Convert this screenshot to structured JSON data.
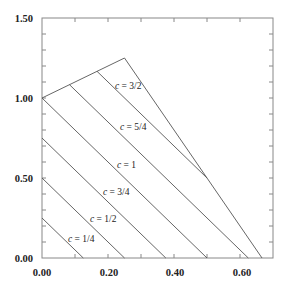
{
  "chart_data": {
    "type": "line",
    "title": "",
    "xlabel": "",
    "ylabel": "",
    "xlim": [
      0,
      0.7
    ],
    "ylim": [
      0,
      1.5
    ],
    "grid": false,
    "legend": "none",
    "x_ticks": [
      0.1,
      0.2,
      0.3,
      0.4,
      0.5,
      0.6
    ],
    "x_tick_labels": [
      {
        "value": 0.0,
        "label": "0.00"
      },
      {
        "value": 0.2,
        "label": "0.20"
      },
      {
        "value": 0.4,
        "label": "0.40"
      },
      {
        "value": 0.6,
        "label": "0.60"
      }
    ],
    "y_ticks": [
      0.1,
      0.2,
      0.3,
      0.4,
      0.5,
      0.6,
      0.7,
      0.8,
      0.9,
      1.0,
      1.1,
      1.2,
      1.3,
      1.4
    ],
    "y_tick_labels": [
      {
        "value": 0.0,
        "label": "0.00"
      },
      {
        "value": 0.5,
        "label": "0.50"
      },
      {
        "value": 1.0,
        "label": "1.00"
      },
      {
        "value": 1.5,
        "label": "1.50"
      }
    ],
    "boundary": {
      "name": "region boundary",
      "points": [
        [
          0.0,
          1.0
        ],
        [
          0.25,
          1.25
        ],
        [
          0.6667,
          0.0
        ]
      ]
    },
    "series": [
      {
        "name": "c = 1/4",
        "c": 0.25,
        "points": [
          [
            0.0,
            0.25
          ],
          [
            0.125,
            0.0
          ]
        ],
        "label_pos": [
          0.09,
          0.08
        ]
      },
      {
        "name": "c = 1/2",
        "c": 0.5,
        "points": [
          [
            0.0,
            0.5
          ],
          [
            0.25,
            0.0
          ]
        ],
        "label_pos": [
          0.155,
          0.24
        ]
      },
      {
        "name": "c = 3/4",
        "c": 0.75,
        "points": [
          [
            0.0,
            0.75
          ],
          [
            0.375,
            0.0
          ]
        ],
        "label_pos": [
          0.195,
          0.41
        ]
      },
      {
        "name": "c = 1",
        "c": 1.0,
        "points": [
          [
            0.0,
            1.0
          ],
          [
            0.5,
            0.0
          ]
        ],
        "label_pos": [
          0.228,
          0.58
        ]
      },
      {
        "name": "c = 5/4",
        "c": 1.25,
        "points": [
          [
            0.0833,
            1.0833
          ],
          [
            0.625,
            0.0
          ]
        ],
        "label_pos": [
          0.24,
          0.82
        ]
      },
      {
        "name": "c = 3/2",
        "c": 1.5,
        "points": [
          [
            0.1667,
            1.1667
          ],
          [
            0.5,
            0.5
          ]
        ],
        "label_pos": [
          0.22,
          1.075
        ]
      }
    ],
    "labels": {
      "c_quarter": {
        "var": "c",
        "rest": " = 1/4"
      },
      "c_half": {
        "var": "c",
        "rest": " = 1/2"
      },
      "c_three_quarter": {
        "var": "c",
        "rest": " = 3/4"
      },
      "c_one": {
        "var": "c",
        "rest": " = 1"
      },
      "c_five_quarter": {
        "var": "c",
        "rest": " = 5/4"
      },
      "c_three_half": {
        "var": "c",
        "rest": " = 3/2"
      }
    },
    "colors": {
      "lines": "#555555",
      "frame": "#888888",
      "text": "#222222"
    }
  }
}
